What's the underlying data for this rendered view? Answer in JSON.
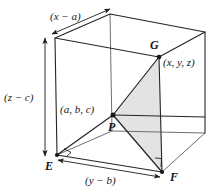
{
  "figure": {
    "type": "geometry-diagram",
    "colors": {
      "stroke": "#1d1d20",
      "stroke_light": "#6b6b70",
      "shade": "#e2e2e2",
      "background": "#ffffff",
      "text": "#17171a"
    },
    "labels": {
      "dim_x": "(x − a)",
      "dim_z": "(z − c)",
      "dim_y": "(y − b)",
      "coord_p": "(a, b, c)",
      "coord_g": "(x, y, z)",
      "vertex_e": "E",
      "vertex_f": "F",
      "vertex_g": "G",
      "vertex_p": "P"
    },
    "geometry": {
      "cube_vertices": {
        "front_top_left": [
          55,
          38
        ],
        "back_top_left": [
          110,
          14
        ],
        "back_top_right": [
          205,
          32
        ],
        "front_top_right": [
          159,
          57
        ],
        "front_bottom_left": [
          57,
          155
        ],
        "back_bottom_left": [
          112,
          131
        ],
        "back_bottom_right": [
          205,
          133
        ],
        "front_bottom_right": [
          162,
          172
        ]
      },
      "point_p": [
        113,
        115
      ],
      "shaded_triangle": [
        [
          113,
          115
        ],
        [
          159,
          57
        ],
        [
          162,
          172
        ]
      ],
      "right_angle_markers": [
        [
          57,
          155
        ],
        [
          162,
          172
        ]
      ]
    }
  }
}
